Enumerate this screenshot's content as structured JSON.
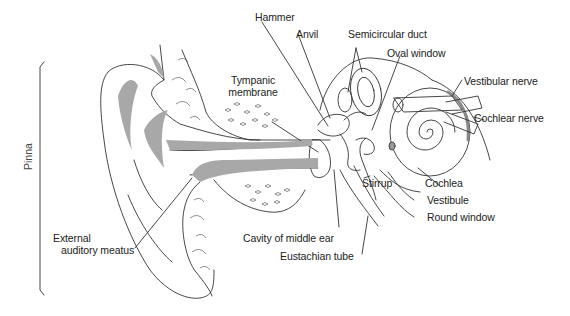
{
  "diagram": {
    "bracket_label": "Pinna",
    "labels": {
      "hammer": "Hammer",
      "anvil": "Anvil",
      "semicircular_duct": "Semicircular duct",
      "oval_window": "Oval window",
      "vestibular_nerve": "Vestibular nerve",
      "cochlear_nerve": "Cochlear nerve",
      "tympanic_membrane_line1": "Tympanic",
      "tympanic_membrane_line2": "membrane",
      "cochlea": "Cochlea",
      "stirrup": "Stirrup",
      "vestibule": "Vestibule",
      "round_window": "Round window",
      "external_auditory_meatus_line1": "External",
      "external_auditory_meatus_line2": "auditory meatus",
      "cavity_of_middle_ear": "Cavity of middle ear",
      "eustachian_tube": "Eustachian tube"
    },
    "colors": {
      "line": "#333333",
      "cartilage_fill": "#a8a8a8",
      "background": "#ffffff"
    }
  }
}
